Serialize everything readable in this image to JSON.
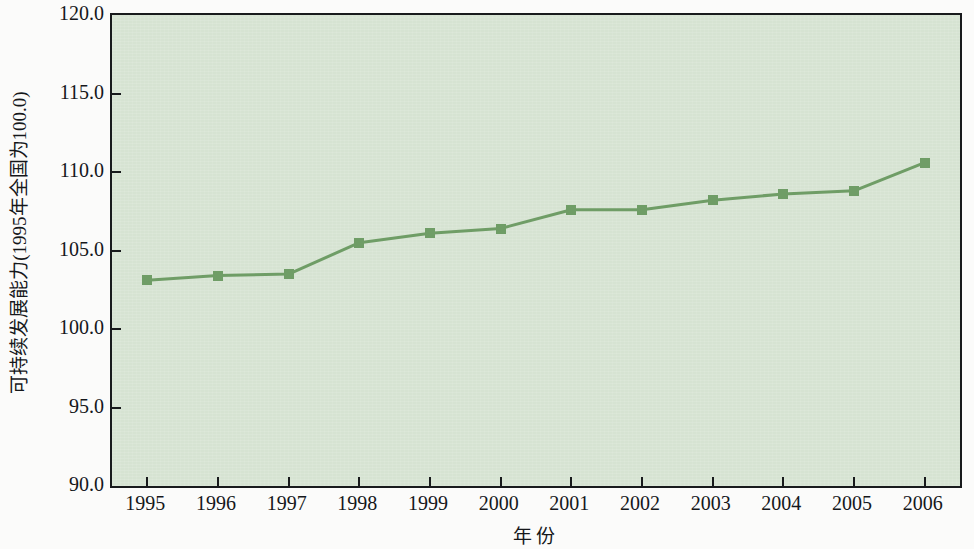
{
  "chart_data": {
    "type": "line",
    "title": "",
    "subtitle": "",
    "xlabel": "年  份",
    "ylabel": "可持续发展能力(1995年全国为100.0)",
    "categories": [
      "1995",
      "1996",
      "1997",
      "1998",
      "1999",
      "2000",
      "2001",
      "2002",
      "2003",
      "2004",
      "2005",
      "2006"
    ],
    "values": [
      103.1,
      103.4,
      103.5,
      105.5,
      106.1,
      106.4,
      107.6,
      107.6,
      108.2,
      108.6,
      108.8,
      110.6
    ],
    "series": [
      {
        "name": "可持续发展能力",
        "values": [
          103.1,
          103.4,
          103.5,
          105.5,
          106.1,
          106.4,
          107.6,
          107.6,
          108.2,
          108.6,
          108.8,
          110.6
        ]
      }
    ],
    "ylim": [
      90.0,
      120.0
    ],
    "ytick_labels": [
      "120.0",
      "115.0",
      "110.0",
      "105.0",
      "100.0",
      "95.0",
      "90.0"
    ],
    "ytick_values": [
      120.0,
      115.0,
      110.0,
      105.0,
      100.0,
      95.0,
      90.0
    ],
    "xtick_labels": [
      "1995",
      "1996",
      "1997",
      "1998",
      "1999",
      "2000",
      "2001",
      "2002",
      "2003",
      "2004",
      "2005",
      "2006"
    ],
    "grid": false,
    "legend": false,
    "legend_position": "none",
    "marker": "square",
    "colors": {
      "line": "#6f9d66",
      "marker": "#6f9d66",
      "plot_background": "#d6e3d2",
      "axis": "#181a1c",
      "text": "#15171a",
      "figure_background": "#fbfbfa"
    },
    "annotations": []
  }
}
